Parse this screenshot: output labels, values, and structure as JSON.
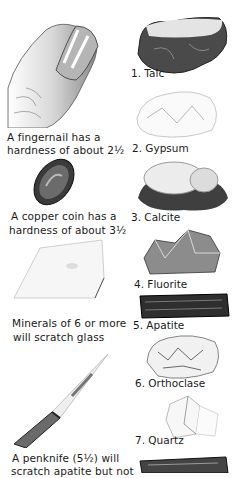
{
  "left_column": [
    {
      "id": "fingernail",
      "caption": [
        "A fingernail has a",
        "hardness of about 2½"
      ],
      "illustration": "fingernail-illustration"
    },
    {
      "id": "copper-coin",
      "caption": [
        "A copper coin has a",
        "hardness of about 3½"
      ],
      "illustration": "copper-coin-illustration"
    },
    {
      "id": "glass",
      "caption": [
        "Minerals of 6 or more",
        "will scratch glass"
      ],
      "illustration": "glass-pane-illustration"
    },
    {
      "id": "penknife",
      "caption": [
        "A penknife (5½) will",
        "scratch apatite but not"
      ],
      "illustration": "penknife-illustration"
    }
  ],
  "minerals": [
    {
      "number": "1.",
      "name": "Talc",
      "label": "1. Talc"
    },
    {
      "number": "2.",
      "name": "Gypsum",
      "label": "2. Gypsum"
    },
    {
      "number": "3.",
      "name": "Calcite",
      "label": "3. Calcite"
    },
    {
      "number": "4.",
      "name": "Fluorite",
      "label": "4. Fluorite"
    },
    {
      "number": "5.",
      "name": "Apatite",
      "label": "5. Apatite"
    },
    {
      "number": "6.",
      "name": "Orthoclase",
      "label": "6. Orthoclase"
    },
    {
      "number": "7.",
      "name": "Quartz",
      "label": "7. Quartz"
    }
  ]
}
